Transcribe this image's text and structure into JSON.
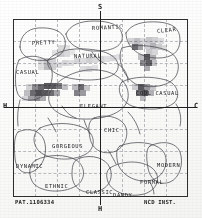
{
  "chart_data": {
    "type": "scatter",
    "xlabel": "H - C",
    "ylabel": "S - H",
    "grid": true,
    "axis_labels": {
      "top": "S",
      "bottom": "H",
      "left": "H",
      "right": "C"
    },
    "xlim": [
      -1,
      1
    ],
    "ylim": [
      -1,
      1
    ],
    "regions": [
      {
        "name": "ROMANTIC",
        "label_x": 92,
        "label_y": 26,
        "rotate": -3
      },
      {
        "name": "CLEAR",
        "label_x": 157,
        "label_y": 29,
        "rotate": -6
      },
      {
        "name": "PRETTY",
        "label_x": 32,
        "label_y": 41,
        "rotate": -3
      },
      {
        "name": "NATURAL",
        "label_x": 74,
        "label_y": 54,
        "rotate": -1
      },
      {
        "name": "CASUAL",
        "label_x": 16,
        "label_y": 70,
        "rotate": 0
      },
      {
        "name": "COOL CASUAL",
        "label_x": 136,
        "label_y": 91,
        "rotate": 0
      },
      {
        "name": "ELEGANT",
        "label_x": 80,
        "label_y": 104,
        "rotate": 0
      },
      {
        "name": "CHIC",
        "label_x": 104,
        "label_y": 128,
        "rotate": 0
      },
      {
        "name": "GORGEOUS",
        "label_x": 52,
        "label_y": 144,
        "rotate": 0
      },
      {
        "name": "DYNAMIC",
        "label_x": 16,
        "label_y": 164,
        "rotate": 0
      },
      {
        "name": "MODERN",
        "label_x": 157,
        "label_y": 163,
        "rotate": 0
      },
      {
        "name": "ETHNIC",
        "label_x": 45,
        "label_y": 184,
        "rotate": 0
      },
      {
        "name": "CLASSIC",
        "label_x": 86,
        "label_y": 190,
        "rotate": 0
      },
      {
        "name": "FORMAL",
        "label_x": 140,
        "label_y": 180,
        "rotate": 0
      },
      {
        "name": "DANDY",
        "label_x": 113,
        "label_y": 193,
        "rotate": 0
      }
    ],
    "heat_clusters": [
      {
        "region": "NATURAL",
        "x": 60,
        "y": 48,
        "intensity": 0.22
      },
      {
        "region": "NATURAL",
        "x": 44,
        "y": 62,
        "intensity": 0.3
      },
      {
        "region": "ELEGANT",
        "x": 84,
        "y": 60,
        "intensity": 0.26
      },
      {
        "region": "CLEAR",
        "x": 150,
        "y": 42,
        "intensity": 0.34
      },
      {
        "region": "CLEAR",
        "x": 136,
        "y": 46,
        "intensity": 0.62
      },
      {
        "region": "COOL CASUAL",
        "x": 146,
        "y": 58,
        "intensity": 0.7
      },
      {
        "region": "COOL CASUAL",
        "x": 144,
        "y": 90,
        "intensity": 0.72
      },
      {
        "region": "CASUAL",
        "x": 40,
        "y": 88,
        "intensity": 0.66
      },
      {
        "region": "CASUAL",
        "x": 58,
        "y": 86,
        "intensity": 0.6
      },
      {
        "region": "ELEGANT",
        "x": 78,
        "y": 90,
        "intensity": 0.55
      }
    ]
  },
  "footer": {
    "left": "PAT.1106334",
    "right": "NCD INST."
  },
  "colors": {
    "frame": "#2e2e2e",
    "axis": "#1f1f1f",
    "grid": "#b9b9bd",
    "region_stroke": "#4a4a50",
    "text": "#232326",
    "blob_dark": "#5a5a5e",
    "blob_mid": "#9a9a9e",
    "blob_light": "#cfcfd2"
  }
}
